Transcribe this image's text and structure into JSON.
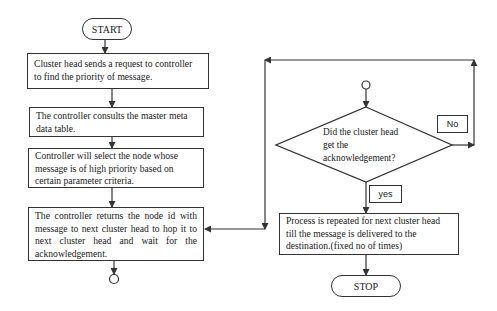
{
  "flowchart": {
    "start_label": "START",
    "stop_label": "STOP",
    "steps": [
      {
        "id": "request",
        "text": "Cluster head sends a request to controller to find the priority of  message."
      },
      {
        "id": "consult",
        "text": "The controller consults the master meta data table."
      },
      {
        "id": "select",
        "text": "Controller will select the node whose message is of high priority based on certain parameter criteria."
      },
      {
        "id": "return",
        "text": "The controller returns the node id with message to next cluster head to hop it to next cluster head and wait for the acknowledgement."
      },
      {
        "id": "repeat",
        "text": "Process is repeated for next cluster head till the message is delivered to the destination.(fixed no of times)"
      }
    ],
    "decision": {
      "lines": [
        "Did the cluster head",
        "get the",
        "acknowledgement?"
      ]
    },
    "branches": {
      "no_label": "No",
      "yes_label": "yes"
    }
  },
  "colors": {
    "stroke": "#333333",
    "background": "#ffffff",
    "text": "#1a1a1a"
  }
}
